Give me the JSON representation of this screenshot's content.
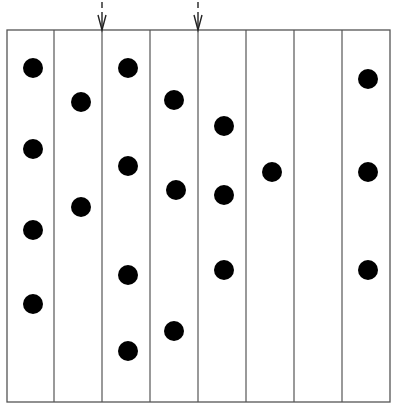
{
  "diagram": {
    "frame": {
      "x": 7,
      "y": 30,
      "width": 383,
      "height": 372,
      "stroke": "#555555"
    },
    "columns": 8,
    "column_lines_x": [
      54,
      102,
      150,
      198,
      246,
      294,
      342
    ],
    "arrows": [
      {
        "x": 102,
        "label": "arrow-marker-1"
      },
      {
        "x": 198,
        "label": "arrow-marker-2"
      }
    ],
    "dot_radius": 10,
    "dot_color": "#000000",
    "dots": [
      {
        "col": 1,
        "x": 33,
        "y": 68
      },
      {
        "col": 1,
        "x": 33,
        "y": 149
      },
      {
        "col": 1,
        "x": 33,
        "y": 230
      },
      {
        "col": 1,
        "x": 33,
        "y": 304
      },
      {
        "col": 2,
        "x": 81,
        "y": 102
      },
      {
        "col": 2,
        "x": 81,
        "y": 207
      },
      {
        "col": 3,
        "x": 128,
        "y": 68
      },
      {
        "col": 3,
        "x": 128,
        "y": 166
      },
      {
        "col": 3,
        "x": 128,
        "y": 275
      },
      {
        "col": 3,
        "x": 128,
        "y": 351
      },
      {
        "col": 4,
        "x": 174,
        "y": 100
      },
      {
        "col": 4,
        "x": 176,
        "y": 190
      },
      {
        "col": 4,
        "x": 174,
        "y": 331
      },
      {
        "col": 5,
        "x": 224,
        "y": 126
      },
      {
        "col": 5,
        "x": 224,
        "y": 195
      },
      {
        "col": 5,
        "x": 224,
        "y": 270
      },
      {
        "col": 6,
        "x": 272,
        "y": 172
      },
      {
        "col": 8,
        "x": 368,
        "y": 79
      },
      {
        "col": 8,
        "x": 368,
        "y": 172
      },
      {
        "col": 8,
        "x": 368,
        "y": 270
      }
    ]
  }
}
